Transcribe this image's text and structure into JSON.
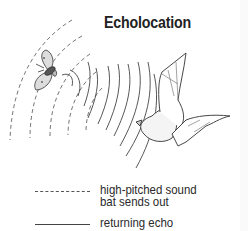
{
  "diagram": {
    "title": "Echolocation",
    "elements": {
      "moth": "moth (prey)",
      "bat": "bat",
      "emitted_waves": "dashed concentric arcs radiating from bat toward moth",
      "echo_waves": "solid arcs returning from moth to bat"
    },
    "legend": [
      {
        "style": "dashed",
        "line1": "high-pitched sound",
        "line2": "bat sends out"
      },
      {
        "style": "solid",
        "line1": "returning echo"
      }
    ],
    "colors": {
      "ink": "#222222",
      "background": "#ffffff"
    }
  }
}
